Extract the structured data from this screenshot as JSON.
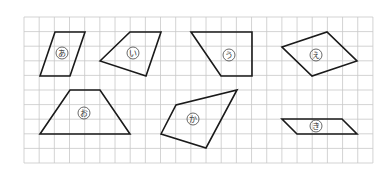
{
  "figure": {
    "grid": {
      "x0": 24,
      "y0": 17,
      "cols": 23,
      "rows": 10,
      "cell_w": 15.17,
      "cell_h": 14.6,
      "line_color": "#c8c8c8"
    },
    "shape_color": "#1a1a1a",
    "shapes": [
      {
        "label": "あ",
        "points": "40,76 55,32 85,32 70,76",
        "label_pos": [
          62,
          53
        ]
      },
      {
        "label": "い",
        "points": "100,61 130,32 161,32 146,76",
        "label_pos": [
          133,
          53
        ]
      },
      {
        "label": "う",
        "points": "191,32 252,32 252,76 221,76",
        "label_pos": [
          229,
          55
        ]
      },
      {
        "label": "え",
        "points": "282,47 327,32 357,61 312,76",
        "label_pos": [
          316,
          55
        ]
      },
      {
        "label": "お",
        "points": "40,134 70,90 100,90 130,134",
        "label_pos": [
          84,
          113
        ]
      },
      {
        "label": "か",
        "points": "161,134 176,105 237,90 206,148",
        "label_pos": [
          193,
          119
        ]
      },
      {
        "label": "き",
        "points": "282,119 342,119 357,134 297,134",
        "label_pos": [
          316,
          126
        ]
      }
    ]
  }
}
